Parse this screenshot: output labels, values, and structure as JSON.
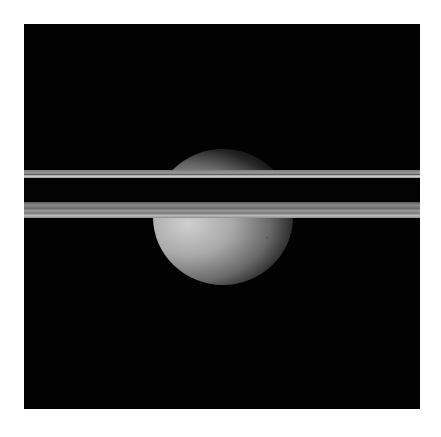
{
  "image": {
    "description": "Grayscale spacecraft image of a moon partially behind edge-on planetary rings on black space background",
    "subject": "moon",
    "features": [
      "upper-ring-band",
      "lower-ring-band",
      "dark-ring-gap",
      "crescent-moon",
      "faint-star"
    ],
    "colors": {
      "background": "#020202",
      "frame": "#ffffff",
      "moon_lit": "#cfcfcf",
      "ring": "#9c9c9c"
    }
  }
}
